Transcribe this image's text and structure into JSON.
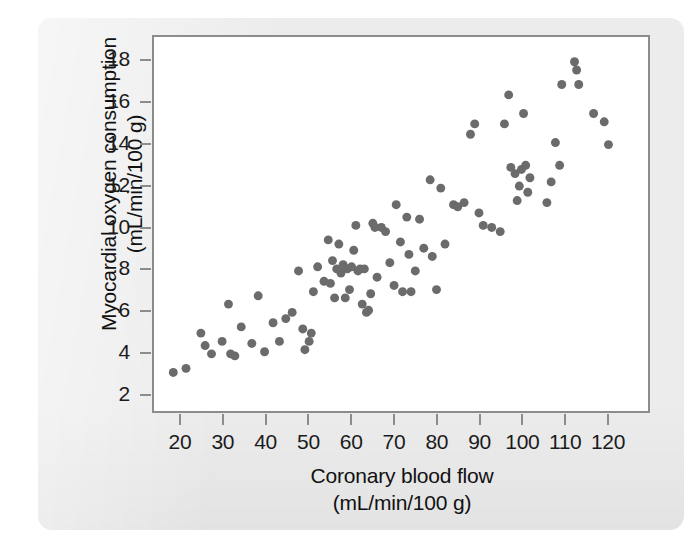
{
  "figure": {
    "background_color": "#ececec",
    "plot_background_color": "#ffffff",
    "frame_color": "#8c8c8c",
    "marker_color": "#6b6b6b"
  },
  "chart_data": {
    "type": "scatter",
    "title": "",
    "xlabel": "Coronary blood flow",
    "xlabel_units": "(mL/min/100 g)",
    "ylabel": "Myocardial oxygen consumption",
    "ylabel_units": "(mL/min/100 g)",
    "xlim": [
      15,
      127
    ],
    "ylim": [
      1.2,
      18.9
    ],
    "xticks": [
      20,
      30,
      40,
      50,
      60,
      70,
      80,
      90,
      100,
      110,
      120
    ],
    "xticklabels": [
      "20",
      "30",
      "40",
      "50",
      "60",
      "70",
      "80",
      "90",
      "100",
      "110",
      "120"
    ],
    "yticks": [
      2,
      4,
      6,
      8,
      10,
      12,
      14,
      16,
      18
    ],
    "yticklabels": [
      "2",
      "4",
      "6",
      "8",
      "10",
      "12",
      "14",
      "16",
      "18"
    ],
    "grid": false,
    "legend": null,
    "marker_size_px": 9,
    "n_points": 96,
    "points": [
      [
        18.0,
        3.0
      ],
      [
        21.0,
        3.2
      ],
      [
        24.5,
        4.9
      ],
      [
        25.5,
        4.3
      ],
      [
        27.0,
        3.9
      ],
      [
        29.5,
        4.5
      ],
      [
        31.0,
        6.3
      ],
      [
        31.5,
        3.9
      ],
      [
        32.5,
        3.8
      ],
      [
        34.0,
        5.2
      ],
      [
        36.5,
        4.4
      ],
      [
        38.0,
        6.7
      ],
      [
        39.5,
        4.0
      ],
      [
        41.5,
        5.4
      ],
      [
        43.0,
        4.5
      ],
      [
        44.5,
        5.6
      ],
      [
        46.0,
        5.9
      ],
      [
        47.5,
        7.9
      ],
      [
        48.5,
        5.1
      ],
      [
        49.0,
        4.1
      ],
      [
        50.0,
        4.5
      ],
      [
        50.5,
        4.9
      ],
      [
        51.0,
        6.9
      ],
      [
        52.0,
        8.1
      ],
      [
        53.5,
        7.4
      ],
      [
        54.5,
        9.4
      ],
      [
        55.0,
        7.3
      ],
      [
        55.5,
        8.4
      ],
      [
        56.0,
        6.6
      ],
      [
        56.5,
        8.0
      ],
      [
        57.0,
        9.2
      ],
      [
        57.5,
        7.8
      ],
      [
        58.0,
        8.2
      ],
      [
        58.5,
        6.6
      ],
      [
        59.0,
        8.0
      ],
      [
        59.5,
        7.0
      ],
      [
        60.0,
        8.1
      ],
      [
        60.5,
        8.9
      ],
      [
        61.0,
        10.1
      ],
      [
        61.5,
        7.9
      ],
      [
        62.0,
        8.0
      ],
      [
        62.5,
        6.3
      ],
      [
        63.0,
        8.0
      ],
      [
        63.5,
        5.9
      ],
      [
        64.0,
        6.0
      ],
      [
        64.5,
        6.8
      ],
      [
        65.0,
        10.2
      ],
      [
        65.5,
        10.0
      ],
      [
        66.0,
        7.6
      ],
      [
        67.0,
        10.0
      ],
      [
        68.0,
        9.8
      ],
      [
        69.0,
        8.3
      ],
      [
        70.0,
        7.2
      ],
      [
        70.5,
        11.1
      ],
      [
        71.5,
        9.3
      ],
      [
        72.0,
        6.9
      ],
      [
        73.0,
        10.5
      ],
      [
        73.5,
        8.7
      ],
      [
        74.0,
        6.9
      ],
      [
        75.0,
        7.9
      ],
      [
        76.0,
        10.4
      ],
      [
        77.0,
        9.0
      ],
      [
        78.5,
        12.3
      ],
      [
        79.0,
        8.6
      ],
      [
        80.0,
        7.0
      ],
      [
        81.0,
        11.9
      ],
      [
        82.0,
        9.2
      ],
      [
        84.0,
        11.1
      ],
      [
        85.0,
        11.0
      ],
      [
        86.5,
        11.2
      ],
      [
        88.0,
        14.5
      ],
      [
        89.0,
        15.0
      ],
      [
        90.0,
        10.7
      ],
      [
        91.0,
        10.1
      ],
      [
        93.0,
        10.0
      ],
      [
        95.0,
        9.8
      ],
      [
        96.0,
        15.0
      ],
      [
        97.0,
        16.4
      ],
      [
        97.5,
        12.9
      ],
      [
        98.5,
        12.6
      ],
      [
        99.0,
        11.3
      ],
      [
        99.5,
        12.0
      ],
      [
        100.0,
        12.8
      ],
      [
        100.5,
        15.5
      ],
      [
        101.0,
        13.0
      ],
      [
        101.5,
        11.7
      ],
      [
        102.0,
        12.4
      ],
      [
        106.0,
        11.2
      ],
      [
        107.0,
        12.2
      ],
      [
        108.0,
        14.1
      ],
      [
        109.0,
        13.0
      ],
      [
        109.5,
        16.9
      ],
      [
        112.5,
        18.0
      ],
      [
        113.0,
        17.6
      ],
      [
        113.5,
        16.9
      ],
      [
        117.0,
        15.5
      ],
      [
        119.5,
        15.1
      ],
      [
        120.5,
        14.0
      ]
    ]
  }
}
